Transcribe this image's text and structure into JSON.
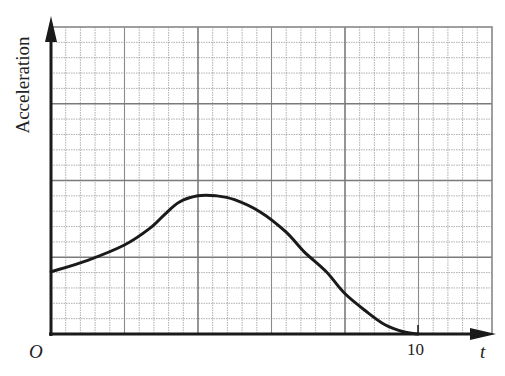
{
  "chart_data": {
    "type": "line",
    "title": "",
    "xlabel": "t",
    "ylabel": "Acceleration",
    "origin_label": "O",
    "x_tick_labels": [
      "10"
    ],
    "x_ticks": [
      10
    ],
    "xlim": [
      0,
      12
    ],
    "ylim": [
      0,
      4
    ],
    "y_tick_labels": [],
    "grid": true,
    "legend": null,
    "series": [
      {
        "name": "acceleration",
        "x": [
          0.0,
          1.0,
          2.0,
          2.7,
          3.1,
          3.5,
          4.0,
          4.5,
          5.0,
          5.7,
          6.4,
          6.9,
          7.5,
          8.0,
          8.6,
          9.1,
          9.6,
          10.0
        ],
        "y": [
          0.81,
          0.96,
          1.16,
          1.38,
          1.56,
          1.72,
          1.8,
          1.8,
          1.75,
          1.59,
          1.33,
          1.07,
          0.81,
          0.53,
          0.29,
          0.12,
          0.03,
          0.0
        ]
      }
    ]
  },
  "labels": {
    "ylabel": "Acceleration",
    "origin": "O",
    "tick_10": "10",
    "xlabel": "t"
  }
}
